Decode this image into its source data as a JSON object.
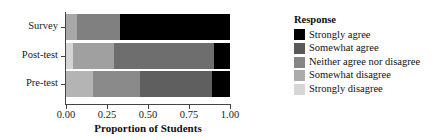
{
  "chart_data": {
    "type": "bar",
    "orientation": "horizontal",
    "stacked": true,
    "normalized": true,
    "title": "",
    "xlabel": "Proportion of Students",
    "ylabel": "",
    "xlim": [
      0.0,
      1.0
    ],
    "xticks": [
      0.0,
      0.25,
      0.5,
      0.75,
      1.0
    ],
    "xticklabels": [
      "0.00",
      "0.25",
      "0.50",
      "0.75",
      "1.00"
    ],
    "grid": false,
    "categories": [
      "Pre-test",
      "Post-test",
      "Survey"
    ],
    "display_order_top_to_bottom": [
      "Survey",
      "Post-test",
      "Pre-test"
    ],
    "legend_title": "Response",
    "legend_position": "right",
    "series": [
      {
        "name": "Strongly agree",
        "color": "#000000",
        "values": [
          0.11,
          0.1,
          0.67
        ]
      },
      {
        "name": "Somewhat agree",
        "color": "#555555",
        "values": [
          0.44,
          0.61,
          0.0
        ]
      },
      {
        "name": "Neither agree nor disagree",
        "color": "#808080",
        "values": [
          0.285,
          0.245,
          0.26
        ]
      },
      {
        "name": "Somewhat disagree",
        "color": "#a8a8a8",
        "values": [
          0.165,
          0.0,
          0.07
        ]
      },
      {
        "name": "Strongly disagree",
        "color": "#d4d4d4",
        "values": [
          0.0,
          0.045,
          0.0
        ]
      }
    ],
    "bars": [
      {
        "category": "Survey",
        "segments": [
          {
            "response": "Somewhat disagree",
            "value": 0.07,
            "start": 0.0,
            "end": 0.07,
            "color": "#a8a8a8"
          },
          {
            "response": "Neither agree nor disagree",
            "value": 0.26,
            "start": 0.07,
            "end": 0.33,
            "color": "#808080"
          },
          {
            "response": "Strongly agree",
            "value": 0.67,
            "start": 0.33,
            "end": 1.0,
            "color": "#000000"
          }
        ]
      },
      {
        "category": "Post-test",
        "segments": [
          {
            "response": "Strongly disagree",
            "value": 0.045,
            "start": 0.0,
            "end": 0.045,
            "color": "#d4d4d4"
          },
          {
            "response": "Neither agree nor disagree",
            "value": 0.245,
            "start": 0.045,
            "end": 0.29,
            "color": "#a0a0a0"
          },
          {
            "response": "Somewhat agree",
            "value": 0.61,
            "start": 0.29,
            "end": 0.9,
            "color": "#6e6e6e"
          },
          {
            "response": "Strongly agree",
            "value": 0.1,
            "start": 0.9,
            "end": 1.0,
            "color": "#000000"
          }
        ]
      },
      {
        "category": "Pre-test",
        "segments": [
          {
            "response": "Somewhat disagree",
            "value": 0.165,
            "start": 0.0,
            "end": 0.165,
            "color": "#b4b4b4"
          },
          {
            "response": "Neither agree nor disagree",
            "value": 0.285,
            "start": 0.165,
            "end": 0.45,
            "color": "#8a8a8a"
          },
          {
            "response": "Somewhat agree",
            "value": 0.44,
            "start": 0.45,
            "end": 0.89,
            "color": "#5f5f5f"
          },
          {
            "response": "Strongly agree",
            "value": 0.11,
            "start": 0.89,
            "end": 1.0,
            "color": "#000000"
          }
        ]
      }
    ]
  },
  "axes": {
    "x_title": "Proportion of Students",
    "x_ticks": [
      {
        "label": "0.00",
        "value": 0.0
      },
      {
        "label": "0.25",
        "value": 0.25
      },
      {
        "label": "0.50",
        "value": 0.5
      },
      {
        "label": "0.75",
        "value": 0.75
      },
      {
        "label": "1.00",
        "value": 1.0
      }
    ],
    "y_ticks": [
      {
        "label": "Survey"
      },
      {
        "label": "Post-test"
      },
      {
        "label": "Pre-test"
      }
    ]
  },
  "legend": {
    "title": "Response",
    "items": [
      {
        "label": "Strongly agree",
        "color": "#000000"
      },
      {
        "label": "Somewhat agree",
        "color": "#595959"
      },
      {
        "label": "Neither agree nor disagree",
        "color": "#858585"
      },
      {
        "label": "Somewhat disagree",
        "color": "#ababab"
      },
      {
        "label": "Strongly disagree",
        "color": "#d6d6d6"
      }
    ]
  },
  "colors": {
    "axis": "#444444",
    "text": "#101010",
    "background": "#ffffff"
  }
}
